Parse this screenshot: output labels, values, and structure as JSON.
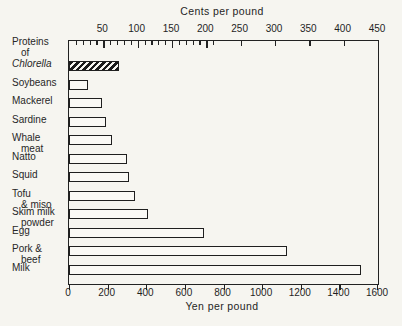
{
  "figure": {
    "background": "#f6f5f0",
    "ink": "#222222",
    "bar_fill": "#faf9f5",
    "hatch_style": "black diagonal stripes"
  },
  "chart_data": {
    "type": "bar",
    "orientation": "horizontal",
    "grid": false,
    "legend": false,
    "top_axis": {
      "title": "Cents per pound",
      "range": [
        0,
        450
      ],
      "major_ticks": [
        50,
        100,
        150,
        200,
        250,
        300,
        350,
        400,
        450
      ],
      "minor_tick_step": 10,
      "minor_tick_max": 210
    },
    "bottom_axis": {
      "title": "Yen per pound",
      "range": [
        0,
        1600
      ],
      "ticks": [
        0,
        200,
        400,
        600,
        800,
        1000,
        1200,
        1400,
        1600
      ]
    },
    "categories": [
      "Proteins of Chlorella",
      "Soybeans",
      "Mackerel",
      "Sardine",
      "Whale meat",
      "Natto",
      "Squid",
      "Tofu & miso",
      "Skim milk powder",
      "Egg",
      "Pork & beef",
      "Milk"
    ],
    "category_lines": [
      [
        {
          "t": "Proteins"
        },
        {
          "t": "of",
          "ind": 1
        },
        {
          "t": "Chlorella",
          "it": 1
        }
      ],
      [
        {
          "t": "Soybeans"
        }
      ],
      [
        {
          "t": "Mackerel"
        }
      ],
      [
        {
          "t": "Sardine"
        }
      ],
      [
        {
          "t": "Whale"
        },
        {
          "t": "meat",
          "ind": 1
        }
      ],
      [
        {
          "t": "Natto"
        }
      ],
      [
        {
          "t": "Squid"
        }
      ],
      [
        {
          "t": "Tofu"
        },
        {
          "t": "& miso",
          "ind": 1
        }
      ],
      [
        {
          "t": "Skim milk"
        },
        {
          "t": "powder",
          "ind": 1
        }
      ],
      [
        {
          "t": "Egg"
        }
      ],
      [
        {
          "t": "Pork &"
        },
        {
          "t": "beef",
          "ind": 1
        }
      ],
      [
        {
          "t": "Milk"
        }
      ]
    ],
    "values_yen": [
      260,
      100,
      170,
      190,
      225,
      300,
      310,
      340,
      410,
      700,
      1130,
      1510
    ],
    "bar_styles": [
      "hatched",
      "open",
      "open",
      "open",
      "open",
      "open",
      "open",
      "open",
      "open",
      "open",
      "open",
      "open"
    ]
  }
}
